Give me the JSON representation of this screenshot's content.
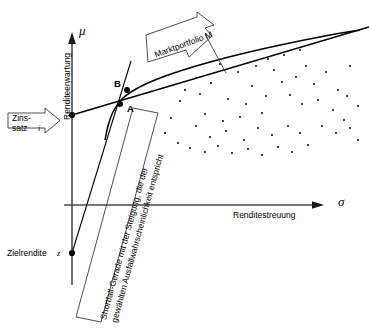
{
  "figure": {
    "background": "#ffffff",
    "stroke": "#000000"
  },
  "axes": {
    "y": {
      "name": "Renditeerwartung",
      "symbol": "μ",
      "orientation": "vertical",
      "arrow": "up"
    },
    "x": {
      "name": "Renditestreuung",
      "symbol": "σ",
      "orientation": "horizontal",
      "arrow": "right"
    }
  },
  "points": [
    {
      "id": "A",
      "label": "A",
      "label_side": "right"
    },
    {
      "id": "B",
      "label": "B",
      "label_side": "left"
    },
    {
      "id": "i",
      "label": "",
      "label_side": "none"
    },
    {
      "id": "z",
      "label": "",
      "label_side": "none"
    }
  ],
  "callouts": {
    "zinssatz": {
      "line1": "Zins-",
      "line2": "satz",
      "symbol": "i",
      "shape": "arrow-box-right"
    },
    "marktportfolio": {
      "text": "Marktportfolio M",
      "shape": "arrow-box-down-right"
    },
    "shortfall": {
      "line1": "Shortfall-Gerade mit der Steigung, die der",
      "line2": "gewählten Ausfallwahrscheinlichkeit entspricht",
      "shape": "rotated-box"
    }
  },
  "labels": {
    "zielrendite": {
      "text": "Zielrendite",
      "symbol": "z"
    }
  },
  "chart_data": {
    "type": "scatter",
    "title": "",
    "xlabel": "Renditestreuung",
    "ylabel": "Renditeerwartung",
    "grid": false,
    "legend": "none",
    "curves": [
      {
        "name": "efficient-frontier",
        "type": "curve",
        "points": [
          [
            105,
            140
          ],
          [
            108,
            126
          ],
          [
            113,
            112
          ],
          [
            122,
            99
          ],
          [
            136,
            89
          ],
          [
            155,
            80
          ],
          [
            180,
            71
          ],
          [
            210,
            62
          ],
          [
            245,
            53
          ],
          [
            285,
            44
          ],
          [
            325,
            36
          ],
          [
            360,
            30
          ]
        ]
      },
      {
        "name": "capital-market-line",
        "type": "line",
        "points": [
          [
            72,
            115
          ],
          [
            369,
            27
          ]
        ]
      },
      {
        "name": "shortfall-line",
        "type": "line",
        "points": [
          [
            131,
            61
          ],
          [
            72,
            253
          ]
        ]
      }
    ],
    "scatter_points": [
      [
        196,
        78
      ],
      [
        200,
        94
      ],
      [
        180,
        101
      ],
      [
        185,
        90
      ],
      [
        220,
        64
      ],
      [
        211,
        83
      ],
      [
        238,
        72
      ],
      [
        252,
        86
      ],
      [
        228,
        99
      ],
      [
        246,
        104
      ],
      [
        205,
        114
      ],
      [
        196,
        126
      ],
      [
        223,
        121
      ],
      [
        240,
        117
      ],
      [
        262,
        113
      ],
      [
        274,
        70
      ],
      [
        282,
        82
      ],
      [
        296,
        77
      ],
      [
        306,
        66
      ],
      [
        314,
        84
      ],
      [
        326,
        72
      ],
      [
        338,
        90
      ],
      [
        350,
        66
      ],
      [
        290,
        95
      ],
      [
        302,
        104
      ],
      [
        318,
        100
      ],
      [
        333,
        110
      ],
      [
        347,
        96
      ],
      [
        358,
        106
      ],
      [
        210,
        137
      ],
      [
        226,
        131
      ],
      [
        244,
        140
      ],
      [
        258,
        128
      ],
      [
        272,
        135
      ],
      [
        288,
        126
      ],
      [
        300,
        133
      ],
      [
        171,
        118
      ],
      [
        165,
        133
      ],
      [
        178,
        143
      ],
      [
        190,
        148
      ],
      [
        205,
        152
      ],
      [
        218,
        146
      ],
      [
        232,
        153
      ],
      [
        248,
        149
      ],
      [
        262,
        155
      ],
      [
        278,
        147
      ],
      [
        292,
        152
      ],
      [
        308,
        145
      ],
      [
        322,
        126
      ],
      [
        336,
        133
      ],
      [
        350,
        128
      ],
      [
        358,
        140
      ],
      [
        344,
        120
      ],
      [
        266,
        96
      ],
      [
        256,
        66
      ],
      [
        268,
        59
      ],
      [
        284,
        55
      ],
      [
        300,
        50
      ]
    ]
  }
}
